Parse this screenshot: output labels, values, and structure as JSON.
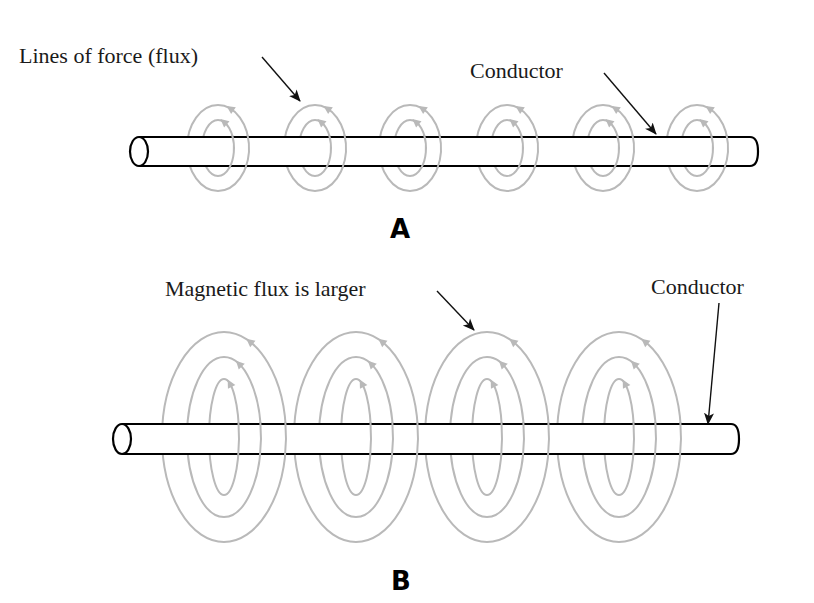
{
  "figure": {
    "panels": [
      {
        "id": "A",
        "letter": "A",
        "labels": {
          "flux": "Lines of force (flux)",
          "conductor": "Conductor"
        },
        "conductor": {
          "x_start": 139,
          "x_end": 757,
          "y_top": 137,
          "y_bottom": 166
        },
        "ring_centers_x": [
          218,
          315,
          410,
          507,
          603,
          697
        ],
        "ring_center_y": 148,
        "rings": [
          {
            "rx": 31,
            "ry": 43
          },
          {
            "rx": 16,
            "ry": 28
          }
        ]
      },
      {
        "id": "B",
        "letter": "B",
        "labels": {
          "flux": "Magnetic flux is larger",
          "conductor": "Conductor"
        },
        "conductor": {
          "x_start": 122,
          "x_end": 738,
          "y_top": 424,
          "y_bottom": 454
        },
        "ring_centers_x": [
          224,
          356,
          487,
          619
        ],
        "ring_center_y": 437,
        "rings": [
          {
            "rx": 62,
            "ry": 105
          },
          {
            "rx": 37,
            "ry": 80
          },
          {
            "rx": 15,
            "ry": 58
          }
        ]
      }
    ],
    "colors": {
      "flux_lines": "#b9b9b9",
      "conductor_outline": "#000000",
      "text": "#1a1a1a"
    }
  }
}
